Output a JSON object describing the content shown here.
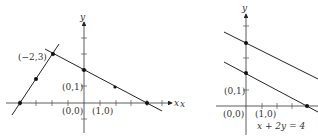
{
  "figures": [
    {
      "id": "left",
      "axes": {
        "x_label": "x",
        "y_label": "y"
      },
      "labels": {
        "point_a": "(−2,3)",
        "point_b": "(0,1)",
        "origin": "(0,0)",
        "unit_x": "(1,0)"
      },
      "lines": [
        {
          "name": "steep-line",
          "points": [
            [
              -4,
              0
            ],
            [
              -3,
              1.5
            ],
            [
              -2,
              3
            ]
          ]
        },
        {
          "name": "sloped-line",
          "points": [
            [
              -2,
              3
            ],
            [
              0,
              2
            ],
            [
              2,
              1
            ],
            [
              4,
              0
            ]
          ]
        }
      ]
    },
    {
      "id": "right",
      "axes": {
        "x_label": "x",
        "y_label": "y"
      },
      "labels": {
        "point_b": "(0,1)",
        "origin": "(0,0)",
        "unit_x": "(1,0)",
        "equation": "x + 2y = 4"
      },
      "lines": [
        {
          "name": "upper-parallel-line",
          "points": [
            [
              0,
              4
            ]
          ]
        },
        {
          "name": "lower-parallel-line",
          "points": [
            [
              0,
              2
            ],
            [
              4,
              0
            ]
          ]
        }
      ]
    }
  ]
}
